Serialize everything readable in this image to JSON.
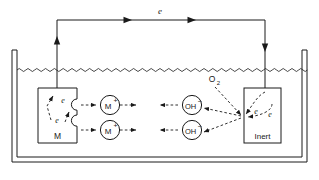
{
  "figure": {
    "type": "schematic-diagram",
    "background_color": "#ffffff",
    "stroke_color": "#1a1a1a",
    "width": 319,
    "height": 180
  },
  "container": {
    "name": "electrolyte-vessel",
    "wall_style": "double-line-open-top-u-shape"
  },
  "electrolyte": {
    "surface_style": "wavy-line",
    "surface_label": ""
  },
  "external_circuit": {
    "label": "e",
    "arrow_count": 2,
    "direction": "left-to-right",
    "left_terminal_arrow": "up",
    "right_terminal_arrow": "down"
  },
  "anode": {
    "name": "metal-electrode",
    "label": "M",
    "edge_style": "corroded-notched",
    "electron_labels": [
      "e",
      "e"
    ]
  },
  "cathode": {
    "name": "inert-electrode",
    "label": "Inert",
    "electron_labels": [
      "e",
      "e"
    ]
  },
  "ions": {
    "cations": [
      {
        "label": "M",
        "charge": "+"
      },
      {
        "label": "M",
        "charge": "+"
      }
    ],
    "anions": [
      {
        "label": "OH",
        "charge": "−"
      },
      {
        "label": "OH",
        "charge": "−"
      }
    ]
  },
  "reactant": {
    "label": "O",
    "subscript": "2"
  }
}
